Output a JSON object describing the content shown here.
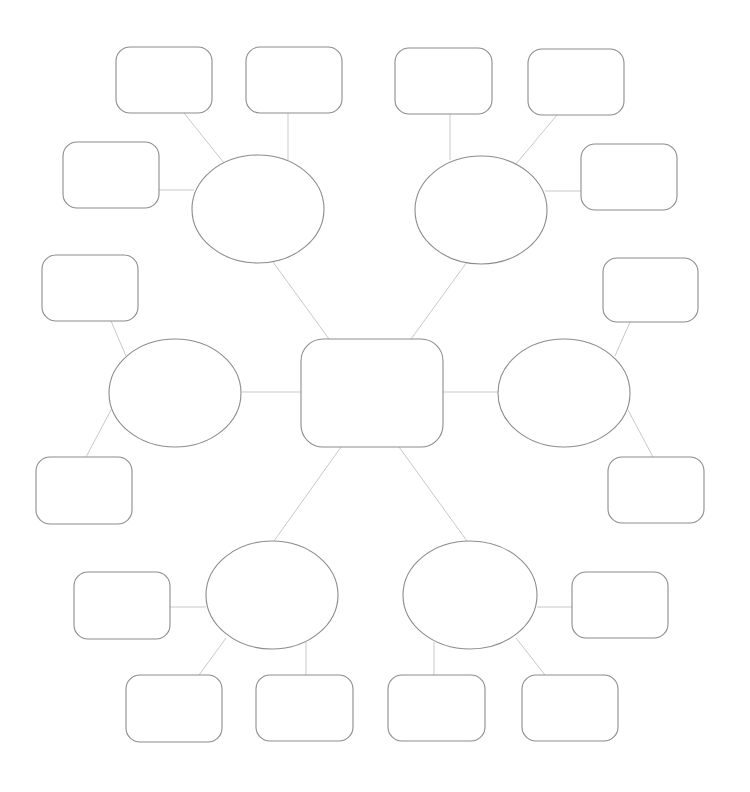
{
  "diagram": {
    "type": "mind-map / bubble map template",
    "colors": {
      "background": "#ffffff",
      "shape_stroke": "#8c8c8c",
      "connector_stroke": "#c9c9c9"
    },
    "center": {
      "id": "center",
      "label": "",
      "x": 301,
      "y": 339,
      "w": 142,
      "h": 108,
      "r": 22
    },
    "branches": [
      {
        "id": "branch-top-left",
        "label": "",
        "cx": 258,
        "cy": 209,
        "rx": 66,
        "ry": 54,
        "leaves": [
          {
            "id": "leaf-tl-1",
            "label": "",
            "x": 116,
            "y": 47,
            "w": 96,
            "h": 66
          },
          {
            "id": "leaf-tl-2",
            "label": "",
            "x": 246,
            "y": 47,
            "w": 96,
            "h": 66
          },
          {
            "id": "leaf-tl-3",
            "label": "",
            "x": 63,
            "y": 142,
            "w": 96,
            "h": 66
          }
        ]
      },
      {
        "id": "branch-top-right",
        "label": "",
        "cx": 481,
        "cy": 210,
        "rx": 66,
        "ry": 54,
        "leaves": [
          {
            "id": "leaf-tr-1",
            "label": "",
            "x": 395,
            "y": 48,
            "w": 97,
            "h": 66
          },
          {
            "id": "leaf-tr-2",
            "label": "",
            "x": 528,
            "y": 49,
            "w": 96,
            "h": 66
          },
          {
            "id": "leaf-tr-3",
            "label": "",
            "x": 581,
            "y": 144,
            "w": 96,
            "h": 66
          }
        ]
      },
      {
        "id": "branch-left",
        "label": "",
        "cx": 175,
        "cy": 393,
        "rx": 66,
        "ry": 54,
        "leaves": [
          {
            "id": "leaf-l-1",
            "label": "",
            "x": 42,
            "y": 255,
            "w": 96,
            "h": 66
          },
          {
            "id": "leaf-l-2",
            "label": "",
            "x": 36,
            "y": 457,
            "w": 96,
            "h": 67
          }
        ]
      },
      {
        "id": "branch-right",
        "label": "",
        "cx": 564,
        "cy": 393,
        "rx": 66,
        "ry": 54,
        "leaves": [
          {
            "id": "leaf-r-1",
            "label": "",
            "x": 603,
            "y": 258,
            "w": 95,
            "h": 64
          },
          {
            "id": "leaf-r-2",
            "label": "",
            "x": 608,
            "y": 457,
            "w": 96,
            "h": 66
          }
        ]
      },
      {
        "id": "branch-bottom-left",
        "label": "",
        "cx": 272,
        "cy": 595,
        "rx": 66,
        "ry": 54,
        "leaves": [
          {
            "id": "leaf-bl-1",
            "label": "",
            "x": 74,
            "y": 572,
            "w": 96,
            "h": 67
          },
          {
            "id": "leaf-bl-2",
            "label": "",
            "x": 126,
            "y": 675,
            "w": 96,
            "h": 67
          },
          {
            "id": "leaf-bl-3",
            "label": "",
            "x": 256,
            "y": 675,
            "w": 97,
            "h": 66
          }
        ]
      },
      {
        "id": "branch-bottom-right",
        "label": "",
        "cx": 470,
        "cy": 595,
        "rx": 67,
        "ry": 54,
        "leaves": [
          {
            "id": "leaf-br-1",
            "label": "",
            "x": 572,
            "y": 572,
            "w": 96,
            "h": 66
          },
          {
            "id": "leaf-br-2",
            "label": "",
            "x": 388,
            "y": 675,
            "w": 97,
            "h": 66
          },
          {
            "id": "leaf-br-3",
            "label": "",
            "x": 522,
            "y": 675,
            "w": 96,
            "h": 66
          }
        ]
      }
    ],
    "connectors": [
      {
        "from": "branch-top-left",
        "to": "center",
        "x1": 273,
        "y1": 262,
        "x2": 329,
        "y2": 339
      },
      {
        "from": "branch-top-right",
        "to": "center",
        "x1": 467,
        "y1": 262,
        "x2": 411,
        "y2": 339
      },
      {
        "from": "branch-left",
        "to": "center",
        "x1": 242,
        "y1": 392,
        "x2": 301,
        "y2": 392
      },
      {
        "from": "branch-right",
        "to": "center",
        "x1": 498,
        "y1": 392,
        "x2": 443,
        "y2": 392
      },
      {
        "from": "center",
        "to": "branch-bottom-left",
        "x1": 341,
        "y1": 447,
        "x2": 274,
        "y2": 541
      },
      {
        "from": "center",
        "to": "branch-bottom-right",
        "x1": 399,
        "y1": 447,
        "x2": 467,
        "y2": 541
      },
      {
        "from": "leaf-tl-1",
        "to": "branch-top-left",
        "x1": 184,
        "y1": 113,
        "x2": 224,
        "y2": 163
      },
      {
        "from": "leaf-tl-2",
        "to": "branch-top-left",
        "x1": 288,
        "y1": 113,
        "x2": 288,
        "y2": 160
      },
      {
        "from": "leaf-tl-3",
        "to": "branch-top-left",
        "x1": 159,
        "y1": 190,
        "x2": 194,
        "y2": 190
      },
      {
        "from": "leaf-tr-1",
        "to": "branch-top-right",
        "x1": 450,
        "y1": 114,
        "x2": 450,
        "y2": 160
      },
      {
        "from": "leaf-tr-2",
        "to": "branch-top-right",
        "x1": 557,
        "y1": 115,
        "x2": 516,
        "y2": 164
      },
      {
        "from": "leaf-tr-3",
        "to": "branch-top-right",
        "x1": 581,
        "y1": 191,
        "x2": 545,
        "y2": 191
      },
      {
        "from": "leaf-l-1",
        "to": "branch-left",
        "x1": 111,
        "y1": 321,
        "x2": 126,
        "y2": 356
      },
      {
        "from": "branch-left",
        "to": "leaf-l-2",
        "x1": 111,
        "y1": 410,
        "x2": 86,
        "y2": 457
      },
      {
        "from": "branch-right",
        "to": "leaf-r-1",
        "x1": 615,
        "y1": 356,
        "x2": 630,
        "y2": 322
      },
      {
        "from": "branch-right",
        "to": "leaf-r-2",
        "x1": 628,
        "y1": 410,
        "x2": 653,
        "y2": 457
      },
      {
        "from": "leaf-bl-1",
        "to": "branch-bottom-left",
        "x1": 170,
        "y1": 607,
        "x2": 206,
        "y2": 607
      },
      {
        "from": "branch-bottom-left",
        "to": "leaf-bl-2",
        "x1": 226,
        "y1": 638,
        "x2": 199,
        "y2": 675
      },
      {
        "from": "branch-bottom-left",
        "to": "leaf-bl-3",
        "x1": 306,
        "y1": 642,
        "x2": 306,
        "y2": 675
      },
      {
        "from": "branch-bottom-right",
        "to": "leaf-br-1",
        "x1": 537,
        "y1": 607,
        "x2": 572,
        "y2": 607
      },
      {
        "from": "branch-bottom-right",
        "to": "leaf-br-2",
        "x1": 434,
        "y1": 642,
        "x2": 434,
        "y2": 675
      },
      {
        "from": "branch-bottom-right",
        "to": "leaf-br-3",
        "x1": 516,
        "y1": 638,
        "x2": 545,
        "y2": 675
      }
    ]
  }
}
